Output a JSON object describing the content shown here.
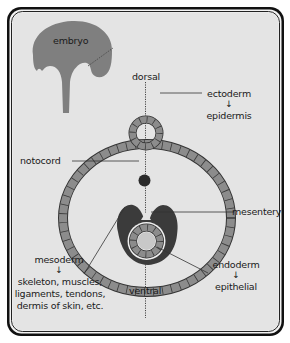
{
  "diagram": {
    "colors": {
      "background": "#e4e4e4",
      "frame": "#111111",
      "tissue_gray": "#8c8c8c",
      "mesoderm_dark": "#3a3a3a",
      "embryo": "#808080",
      "text": "#1a1a1a"
    },
    "labels": {
      "embryo": "embryo",
      "dorsal": "dorsal",
      "ventral": "ventral",
      "ectoderm": "ectoderm",
      "ectoderm_arrow": "↓",
      "epidermis": "epidermis",
      "notocord": "notocord",
      "mesentery": "mesentery",
      "mesoderm": "mesoderm",
      "mesoderm_arrow": "↓",
      "mesoderm_products": [
        "skeleton, muscles,",
        "ligaments, tendons,",
        "dermis of skin, etc."
      ],
      "endoderm": "endoderm",
      "endoderm_arrow": "↓",
      "epithelial": "epithelial"
    }
  }
}
